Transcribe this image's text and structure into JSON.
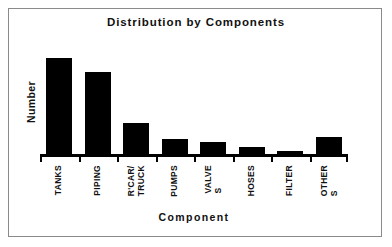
{
  "chart_data": {
    "type": "bar",
    "title": "Distribution by Components",
    "xlabel": "Component",
    "ylabel": "Number",
    "categories": [
      "TANKS",
      "PIPING",
      "R'CAR/\nTRUCK",
      "PUMPS",
      "VALVE\nS",
      "HOSES",
      "FILTER",
      "OTHER\nS"
    ],
    "category_labels_plain": [
      "TANKS",
      "PIPING",
      "R'CAR/TRUCK",
      "PUMPS",
      "VALVES",
      "HOSES",
      "FILTER",
      "OTHERS"
    ],
    "values": [
      96,
      82,
      31,
      15,
      12,
      7,
      3,
      17
    ],
    "ylim": [
      0,
      114
    ],
    "xlim": null,
    "grid": false,
    "legend": null,
    "bar_color": "#000000",
    "background_color": "#ffffff",
    "axis_color": "#000000",
    "frame_color": "#8a8a8a",
    "tick_labels_y": [],
    "annotations": []
  }
}
